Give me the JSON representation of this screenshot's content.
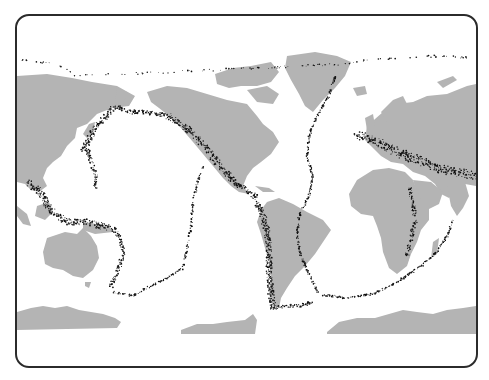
{
  "map": {
    "title": "World seismicity map",
    "projection": "Pacific-centered equirectangular",
    "colors": {
      "land": "#b4b4b4",
      "ocean": "#ffffff",
      "earthquake": "#111111",
      "frame": "#2b2b2b"
    },
    "landmasses": [
      {
        "name": "Eurasia (east)"
      },
      {
        "name": "North America"
      },
      {
        "name": "Greenland"
      },
      {
        "name": "Canadian Arctic Archipelago"
      },
      {
        "name": "Europe / Asia (west)"
      },
      {
        "name": "Africa"
      },
      {
        "name": "Arabia"
      },
      {
        "name": "India"
      },
      {
        "name": "South America"
      },
      {
        "name": "Australia"
      },
      {
        "name": "Madagascar"
      },
      {
        "name": "Antarctica (west)"
      },
      {
        "name": "Antarctica (peninsula)"
      },
      {
        "name": "Antarctica (east)"
      }
    ],
    "seismic_zones": [
      {
        "name": "Aleutian arc"
      },
      {
        "name": "Kuril-Japan trench"
      },
      {
        "name": "Izu-Mariana arc"
      },
      {
        "name": "Philippines-Indonesia"
      },
      {
        "name": "Tonga-Kermadec"
      },
      {
        "name": "Pacific coast of North America"
      },
      {
        "name": "Central America"
      },
      {
        "name": "Andes"
      },
      {
        "name": "Mid-Atlantic Ridge"
      },
      {
        "name": "Alpine-Himalayan belt"
      },
      {
        "name": "East African Rift"
      },
      {
        "name": "Southwest Indian Ridge"
      },
      {
        "name": "East Pacific Rise"
      },
      {
        "name": "Pacific-Antarctic Ridge"
      },
      {
        "name": "Scotia arc"
      },
      {
        "name": "Arctic ridge"
      }
    ]
  }
}
